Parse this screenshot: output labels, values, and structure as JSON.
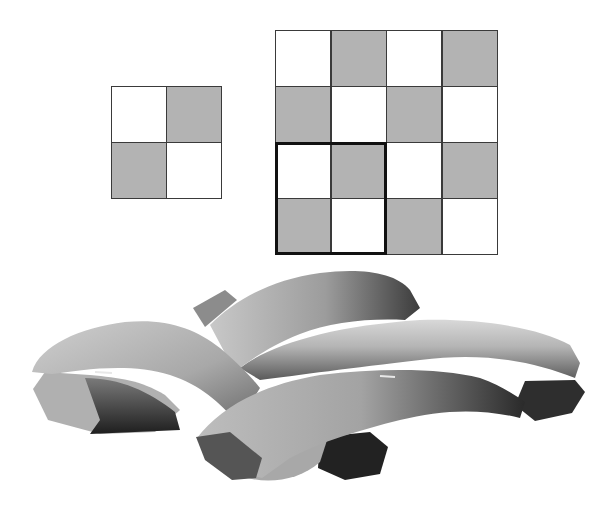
{
  "figure": {
    "colors": {
      "shaded_cell": "#b3b3b3",
      "empty_cell": "#ffffff",
      "grid_line": "#3a3a3a",
      "highlight_border": "#111111"
    },
    "small_grid": {
      "rows": 2,
      "cols": 2,
      "pattern": [
        [
          0,
          1
        ],
        [
          1,
          0
        ]
      ]
    },
    "large_grid": {
      "rows": 4,
      "cols": 4,
      "pattern": [
        [
          0,
          1,
          0,
          1
        ],
        [
          1,
          0,
          1,
          0
        ],
        [
          0,
          1,
          0,
          1
        ],
        [
          1,
          0,
          1,
          0
        ]
      ],
      "highlighted_unit_cell": {
        "row_start": 2,
        "col_start": 0,
        "rows": 2,
        "cols": 2
      }
    },
    "weave_3d": {
      "label": "3D woven yarns (plain weave)",
      "yarn_count": 4
    }
  }
}
